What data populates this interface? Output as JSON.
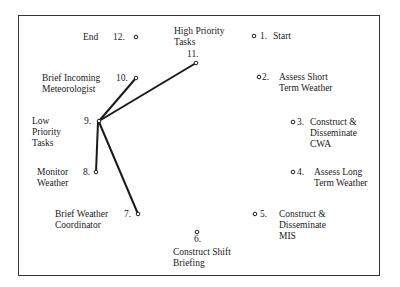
{
  "diagram": {
    "type": "task-network",
    "center_label": "High Priority Tasks",
    "nodes": [
      {
        "id": 1,
        "num": "1.",
        "label": "Start"
      },
      {
        "id": 2,
        "num": "2.",
        "label": "Assess Short\nTerm Weather"
      },
      {
        "id": 3,
        "num": "3.",
        "label": "Construct &\nDisseminate\nCWA"
      },
      {
        "id": 4,
        "num": "4.",
        "label": "Assess Long\nTerm Weather"
      },
      {
        "id": 5,
        "num": "5.",
        "label": "Construct &\nDisseminate\nMIS"
      },
      {
        "id": 6,
        "num": "6.",
        "label": "Construct Shift\nBriefing"
      },
      {
        "id": 7,
        "num": "7.",
        "label": "Brief Weather\nCoordinator"
      },
      {
        "id": 8,
        "num": "8.",
        "label": "Monitor\nWeather"
      },
      {
        "id": 9,
        "num": "9.",
        "label": "Low\nPriority\nTasks"
      },
      {
        "id": 10,
        "num": "10.",
        "label": "Brief Incoming\nMeteorologist"
      },
      {
        "id": 11,
        "num": "11.",
        "label": "High Priority\nTasks"
      },
      {
        "id": 12,
        "num": "12.",
        "label": "End"
      }
    ],
    "edges": [
      {
        "from": 9,
        "to": 10
      },
      {
        "from": 9,
        "to": 11
      },
      {
        "from": 9,
        "to": 8
      },
      {
        "from": 9,
        "to": 7
      }
    ],
    "colors": {
      "line": "#1a1a1a",
      "frame": "#333333"
    }
  }
}
